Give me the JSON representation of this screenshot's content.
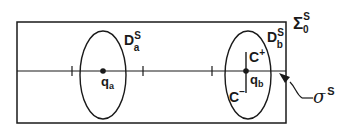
{
  "diagram": {
    "type": "geometric-schematic",
    "colors": {
      "stroke": "#1a1a1a",
      "background": "#ffffff"
    },
    "frame": {
      "label_main": "Σ",
      "label_sup": "S",
      "label_sub": "0"
    },
    "axis": {
      "label_main": "σ",
      "label_sup": "S"
    },
    "disk_a": {
      "label_main": "D",
      "label_sup": "S",
      "label_sub": "a"
    },
    "disk_b": {
      "label_main": "D",
      "label_sup": "S",
      "label_sub": "b"
    },
    "point_a": {
      "label_main": "q",
      "label_sub": "a"
    },
    "point_b": {
      "label_main": "q",
      "label_sub": "b"
    },
    "curve_plus": {
      "label_main": "C",
      "label_sup": "+"
    },
    "curve_minus": {
      "label_main": "C",
      "label_sup": "−"
    }
  }
}
